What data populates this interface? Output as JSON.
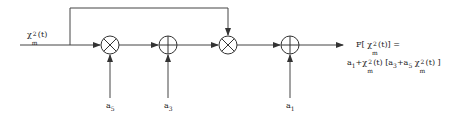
{
  "diagram": {
    "input": {
      "label_base": "χ",
      "label_sup": "2",
      "label_sub": "m",
      "label_arg": "(t)"
    },
    "blocks": [
      {
        "id": "mult-1",
        "type": "multiply",
        "symbol": "⊗"
      },
      {
        "id": "add-1",
        "type": "add",
        "symbol": "⊕"
      },
      {
        "id": "mult-2",
        "type": "multiply",
        "symbol": "⊗"
      },
      {
        "id": "add-2",
        "type": "add",
        "symbol": "⊕"
      }
    ],
    "coefficients": [
      {
        "base": "a",
        "sub": "5",
        "target": "mult-1"
      },
      {
        "base": "a",
        "sub": "3",
        "target": "add-1"
      },
      {
        "base": "a",
        "sub": "1",
        "target": "add-2"
      }
    ],
    "output": {
      "line1_prefix": "F[ χ",
      "line1_sup": "2",
      "line1_sub": "m",
      "line1_suffix": "(t)] =",
      "line2": {
        "p1": "a",
        "p1_sub": "1",
        "p2": "+χ",
        "p2_sup": "2",
        "p2_sub": "m",
        "p3": "(t) [a",
        "p3_sub": "3",
        "p4": "+a",
        "p4_sub": "5",
        "p5": " χ",
        "p5_sup": "2",
        "p5_sub": "m",
        "p6": "(t) ]"
      }
    },
    "colors": {
      "line": "#333333",
      "background": "#ffffff"
    }
  }
}
